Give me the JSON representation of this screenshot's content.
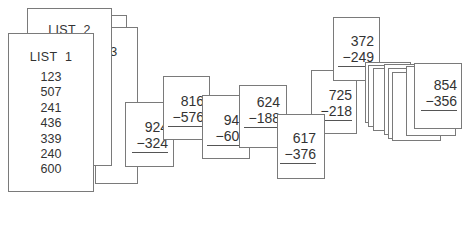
{
  "list1": {
    "title": "LIST  1",
    "items": [
      "123",
      "507",
      "241",
      "436",
      "339",
      "240",
      "600"
    ]
  },
  "list2": {
    "title": "LIST  2"
  },
  "list3_fragment": "3",
  "problems": [
    {
      "minuend": "924",
      "subtrahend": "−324"
    },
    {
      "minuend": "816",
      "subtrahend": "−576"
    },
    {
      "minuend": "948",
      "subtrahend": "−609"
    },
    {
      "minuend": "624",
      "subtrahend": "−188"
    },
    {
      "minuend": "617",
      "subtrahend": "−376"
    },
    {
      "minuend": "725",
      "subtrahend": "−218"
    },
    {
      "minuend": "372",
      "subtrahend": "−249"
    },
    {
      "minuend": "854",
      "subtrahend": "−356"
    }
  ]
}
